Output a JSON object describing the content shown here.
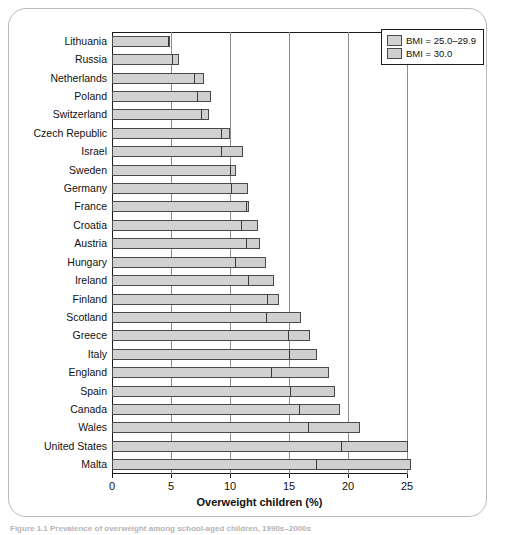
{
  "figure": {
    "axis_title": "Overweight children (%)",
    "caption": "Figure 1.1  Prevalence of overweight among school-aged children, 1990s–2000s"
  },
  "legend": {
    "position": "top-right",
    "items": [
      {
        "label": "BMI = 25.0–29.9",
        "color": "#d2d2d2"
      },
      {
        "label": "BMI = 30.0",
        "color": "#cfcfcf"
      }
    ]
  },
  "axis": {
    "ticks": [
      "0",
      "5",
      "10",
      "15",
      "20",
      "25"
    ],
    "tick_values": [
      0,
      5,
      10,
      15,
      20,
      25
    ],
    "min": 0,
    "max": 25
  },
  "chart_data": {
    "type": "bar",
    "orientation": "horizontal",
    "stacked": true,
    "title": "",
    "subtitle": "",
    "xlabel": "Overweight children (%)",
    "ylabel": "",
    "xlim": [
      0,
      25
    ],
    "grid": true,
    "gridlines_x": [
      5,
      10,
      15,
      20,
      25
    ],
    "legend_position": "top-right",
    "categories": [
      "Lithuania",
      "Russia",
      "Netherlands",
      "Poland",
      "Switzerland",
      "Czech Republic",
      "Israel",
      "Sweden",
      "Germany",
      "France",
      "Croatia",
      "Austria",
      "Hungary",
      "Ireland",
      "Finland",
      "Scotland",
      "Greece",
      "Italy",
      "England",
      "Spain",
      "Canada",
      "Wales",
      "United States",
      "Malta"
    ],
    "series": [
      {
        "name": "BMI = 25.0–29.9",
        "values": [
          4.8,
          5.2,
          7.0,
          7.3,
          7.6,
          9.3,
          9.3,
          10.1,
          10.2,
          11.4,
          11.0,
          11.4,
          10.5,
          11.6,
          13.2,
          13.1,
          15.0,
          15.1,
          13.6,
          15.2,
          15.9,
          16.7,
          19.5,
          17.4
        ]
      },
      {
        "name": "BMI = 30.0",
        "values": [
          0.2,
          0.6,
          0.9,
          1.2,
          0.7,
          0.8,
          1.9,
          0.5,
          1.4,
          0.3,
          1.5,
          1.2,
          2.6,
          2.2,
          1.0,
          3.0,
          1.9,
          2.4,
          4.9,
          3.8,
          3.5,
          4.4,
          5.7,
          8.0
        ]
      }
    ],
    "totals": [
      5.0,
      5.8,
      7.9,
      8.5,
      8.3,
      10.1,
      11.2,
      10.6,
      11.6,
      11.7,
      12.5,
      12.6,
      13.1,
      13.8,
      14.2,
      16.1,
      16.9,
      17.5,
      18.5,
      19.0,
      19.4,
      21.1,
      25.2,
      25.4
    ]
  }
}
